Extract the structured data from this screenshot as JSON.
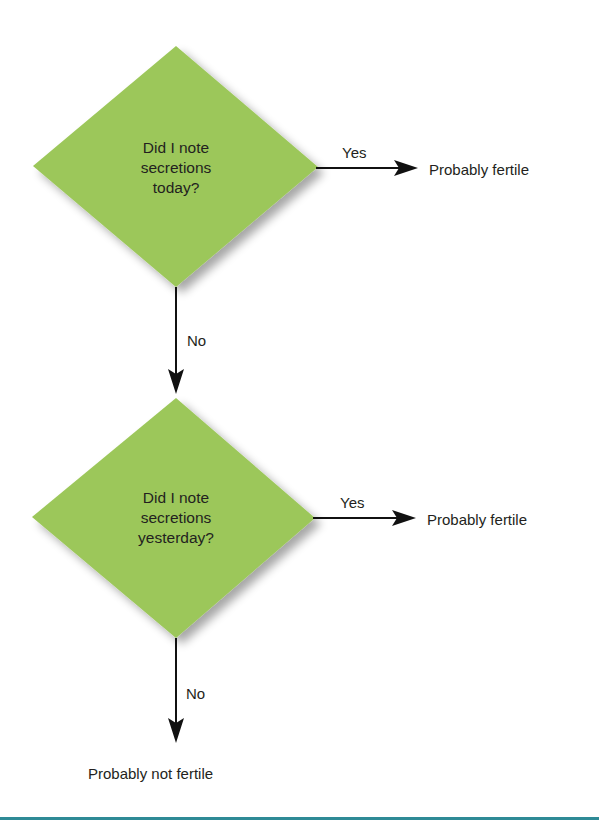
{
  "colors": {
    "diamond_fill": "#9cc75a",
    "line": "#111111",
    "rule": "#2e8a96"
  },
  "nodes": {
    "decision1": {
      "line1": "Did I note",
      "line2": "secretions",
      "line3": "today?"
    },
    "decision2": {
      "line1": "Did I note",
      "line2": "secretions",
      "line3": "yesterday?"
    },
    "outcome1": "Probably fertile",
    "outcome2": "Probably fertile",
    "outcome3": "Probably not fertile"
  },
  "edges": {
    "d1_yes": "Yes",
    "d1_no": "No",
    "d2_yes": "Yes",
    "d2_no": "No"
  }
}
